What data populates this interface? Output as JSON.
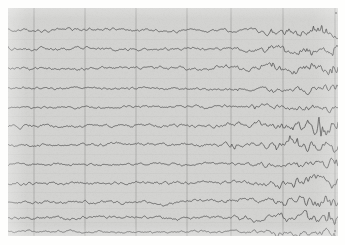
{
  "document": {
    "kind": "eeg-chart-recording",
    "title": "EEG multichannel trace recording",
    "media": "scanned paper strip chart",
    "visible_text": []
  },
  "canvas": {
    "width": 345,
    "height": 245,
    "page_background": "#fefefd",
    "paper": {
      "x": 8,
      "y": 8,
      "width": 330,
      "height": 228,
      "color": "#d3d3d1"
    }
  },
  "colors": {
    "paper": "#d3d3d1",
    "trace": "#4e4e4e",
    "gridline": "#8f8f8d",
    "page": "#fefefd"
  },
  "chart_data": {
    "type": "line",
    "title": "",
    "subtitle": "",
    "xlabel": "",
    "ylabel": "",
    "grid": true,
    "legend_position": "none",
    "axis_visible": false,
    "tick_labels_visible": false,
    "x": {
      "min": 0,
      "max": 330,
      "unit": "px-time",
      "gridlines": [
        26,
        77,
        128,
        179,
        223,
        275,
        327
      ]
    },
    "ylim": [
      0,
      228
    ],
    "n_channels": 12,
    "channel_spacing_px": 19,
    "series": [
      {
        "name": "channel-1",
        "baseline": 22,
        "amplitude_left": 4,
        "amplitude_right": 14,
        "values": [
          22,
          21,
          23,
          20,
          22,
          19,
          21,
          18,
          20,
          19,
          21,
          20,
          22,
          21,
          20,
          22,
          21,
          19,
          21,
          20,
          22,
          21,
          23,
          22,
          21,
          23,
          22,
          24,
          23,
          22,
          24,
          23,
          22,
          24,
          23,
          21,
          23,
          22,
          20,
          22,
          21,
          23,
          22,
          21,
          23,
          22,
          24,
          23,
          25,
          24,
          23,
          25,
          24,
          26,
          25,
          24,
          23,
          25,
          24,
          22,
          24,
          23,
          25,
          24,
          23,
          21,
          23,
          22,
          20,
          22,
          21,
          19,
          21,
          20,
          22,
          21,
          20,
          22,
          21,
          23,
          22,
          20,
          22,
          21,
          19,
          21,
          20,
          22,
          21,
          23,
          22,
          24,
          23,
          22,
          20,
          22,
          21,
          23,
          22,
          24,
          23,
          21,
          23,
          22,
          24,
          23,
          25,
          24,
          22,
          24,
          23,
          25,
          24,
          26,
          25,
          23,
          25,
          24,
          22,
          24,
          23,
          21,
          23,
          22,
          24,
          23,
          25,
          24,
          22,
          20,
          22,
          21,
          19,
          21,
          20,
          18,
          20,
          19,
          21,
          20,
          22,
          21,
          23,
          22,
          24,
          23,
          21,
          23,
          22,
          24,
          23,
          25,
          24,
          26,
          25,
          27,
          26,
          24,
          26,
          25,
          23,
          25,
          24,
          22,
          24,
          23,
          21,
          23,
          22,
          24,
          23,
          25,
          24,
          26,
          25,
          23,
          25,
          24,
          26,
          25,
          23,
          25,
          24,
          22,
          24,
          23,
          25,
          24,
          26,
          25,
          27,
          26,
          28,
          27,
          25,
          27,
          26,
          24,
          26,
          25,
          23,
          25,
          24,
          26,
          25,
          27,
          26,
          24,
          26,
          25,
          23,
          25,
          24,
          26,
          25,
          27,
          26,
          28,
          27,
          25,
          23,
          25,
          24,
          22,
          24,
          23,
          21,
          23,
          22,
          24,
          23,
          25,
          24,
          22,
          24,
          23,
          25,
          24,
          26,
          25,
          23,
          21,
          23,
          22,
          24,
          23,
          21,
          19,
          17,
          19,
          21,
          23,
          25,
          22,
          18,
          14,
          18,
          22,
          26,
          24,
          20,
          16,
          12,
          16,
          20,
          24,
          28,
          25,
          21,
          17,
          13,
          17,
          21,
          25,
          29,
          26,
          22,
          18,
          22,
          26,
          30,
          27,
          23,
          19,
          15,
          19,
          23,
          27,
          24,
          20,
          16,
          20,
          24,
          28,
          25,
          21,
          17,
          21,
          25,
          22,
          18,
          22,
          26,
          23,
          19,
          23,
          27,
          24,
          20,
          24,
          21,
          25,
          22,
          26,
          23
        ]
      },
      {
        "name": "channel-2",
        "baseline": 41,
        "amplitude_left": 4,
        "amplitude_right": 16
      },
      {
        "name": "channel-3",
        "baseline": 60,
        "amplitude_left": 4,
        "amplitude_right": 18
      },
      {
        "name": "channel-4",
        "baseline": 80,
        "amplitude_left": 3,
        "amplitude_right": 14
      },
      {
        "name": "channel-5",
        "baseline": 99,
        "amplitude_left": 3,
        "amplitude_right": 12
      },
      {
        "name": "channel-6",
        "baseline": 118,
        "amplitude_left": 4,
        "amplitude_right": 20
      },
      {
        "name": "channel-7",
        "baseline": 137,
        "amplitude_left": 4,
        "amplitude_right": 16
      },
      {
        "name": "channel-8",
        "baseline": 156,
        "amplitude_left": 3,
        "amplitude_right": 13
      },
      {
        "name": "channel-9",
        "baseline": 175,
        "amplitude_left": 4,
        "amplitude_right": 17
      },
      {
        "name": "channel-10",
        "baseline": 194,
        "amplitude_left": 4,
        "amplitude_right": 19
      },
      {
        "name": "channel-11",
        "baseline": 210,
        "amplitude_left": 4,
        "amplitude_right": 16
      },
      {
        "name": "channel-12",
        "baseline": 224,
        "amplitude_left": 3,
        "amplitude_right": 12
      }
    ]
  }
}
